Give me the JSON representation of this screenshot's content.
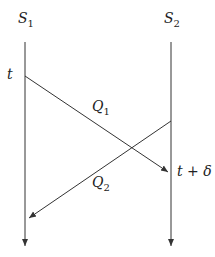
{
  "diagram": {
    "processes": [
      {
        "name": "S",
        "sub": "1"
      },
      {
        "name": "S",
        "sub": "2"
      }
    ],
    "messages": [
      {
        "name": "Q",
        "sub": "1",
        "from": "S1",
        "to": "S2"
      },
      {
        "name": "Q",
        "sub": "2",
        "from": "S2",
        "to": "S1"
      }
    ],
    "time_labels": {
      "send": "t",
      "receive": "t + δ"
    },
    "line_color": "#333333"
  }
}
